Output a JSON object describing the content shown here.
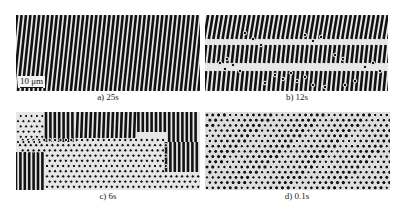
{
  "figure": {
    "panels": [
      {
        "id": "a",
        "caption": "a) 25s",
        "pattern": "stripes"
      },
      {
        "id": "b",
        "caption": "b) 12s",
        "pattern": "stripes-with-hexagonal-domains"
      },
      {
        "id": "c",
        "caption": "c) 6s",
        "pattern": "mixed-stripes-and-hexagons"
      },
      {
        "id": "d",
        "caption": "d) 0.1s",
        "pattern": "hexagonal-dots"
      }
    ],
    "scale_bar": "10 μm"
  }
}
